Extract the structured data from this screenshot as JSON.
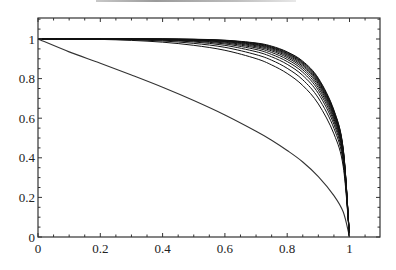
{
  "chart_data": {
    "type": "line",
    "title": "",
    "xlabel": "",
    "ylabel": "",
    "xlim": [
      0,
      1.1
    ],
    "ylim": [
      0,
      1.1
    ],
    "grid": false,
    "legend": null,
    "x_ticks": [
      "0",
      "0.2",
      "0.4",
      "0.6",
      "0.8",
      "1"
    ],
    "y_ticks": [
      "0",
      "0.2",
      "0.4",
      "0.6",
      "0.8",
      "1"
    ],
    "x_tick_values": [
      0,
      0.2,
      0.4,
      0.6,
      0.8,
      1
    ],
    "y_tick_values": [
      0,
      0.2,
      0.4,
      0.6,
      0.8,
      1
    ],
    "line_color": "#000000",
    "x": [
      0,
      0.1,
      0.2,
      0.3,
      0.4,
      0.5,
      0.6,
      0.7,
      0.75,
      0.8,
      0.85,
      0.9,
      0.95,
      0.98,
      1
    ],
    "series": [
      {
        "name": "curve-lower",
        "values": [
          1,
          0.935,
          0.878,
          0.818,
          0.756,
          0.689,
          0.616,
          0.534,
          0.489,
          0.437,
          0.379,
          0.305,
          0.209,
          0.126,
          0
        ]
      },
      {
        "name": "curve-1",
        "values": [
          1,
          1,
          0.998,
          0.993,
          0.984,
          0.968,
          0.943,
          0.901,
          0.869,
          0.826,
          0.765,
          0.672,
          0.521,
          0.354,
          0
        ]
      },
      {
        "name": "curve-2",
        "values": [
          1,
          1,
          0.999,
          0.996,
          0.99,
          0.978,
          0.958,
          0.921,
          0.893,
          0.852,
          0.794,
          0.702,
          0.549,
          0.375,
          0
        ]
      },
      {
        "name": "curve-3",
        "values": [
          1,
          1,
          1,
          0.998,
          0.994,
          0.985,
          0.968,
          0.936,
          0.91,
          0.872,
          0.816,
          0.725,
          0.569,
          0.39,
          0
        ]
      },
      {
        "name": "curve-4",
        "values": [
          1,
          1,
          1,
          0.999,
          0.996,
          0.989,
          0.975,
          0.947,
          0.922,
          0.886,
          0.832,
          0.741,
          0.584,
          0.401,
          0
        ]
      },
      {
        "name": "curve-5",
        "values": [
          1,
          1,
          1,
          0.999,
          0.997,
          0.992,
          0.98,
          0.955,
          0.932,
          0.897,
          0.844,
          0.754,
          0.596,
          0.41,
          0
        ]
      },
      {
        "name": "curve-6",
        "values": [
          1,
          1,
          1,
          1,
          0.998,
          0.994,
          0.984,
          0.961,
          0.94,
          0.906,
          0.854,
          0.765,
          0.606,
          0.417,
          0
        ]
      },
      {
        "name": "curve-7",
        "values": [
          1,
          1,
          1,
          1,
          0.999,
          0.995,
          0.987,
          0.966,
          0.946,
          0.913,
          0.862,
          0.774,
          0.614,
          0.423,
          0
        ]
      },
      {
        "name": "curve-8",
        "values": [
          1,
          1,
          1,
          1,
          0.999,
          0.996,
          0.989,
          0.97,
          0.951,
          0.919,
          0.869,
          0.781,
          0.621,
          0.428,
          0
        ]
      },
      {
        "name": "curve-9",
        "values": [
          1,
          1,
          1,
          1,
          0.999,
          0.997,
          0.991,
          0.973,
          0.955,
          0.924,
          0.875,
          0.787,
          0.627,
          0.433,
          0
        ]
      },
      {
        "name": "curve-10",
        "values": [
          1,
          1,
          1,
          1,
          1,
          0.998,
          0.992,
          0.976,
          0.958,
          0.928,
          0.88,
          0.793,
          0.632,
          0.437,
          0
        ]
      },
      {
        "name": "curve-11",
        "values": [
          1,
          1,
          1,
          1,
          1,
          0.998,
          0.993,
          0.978,
          0.961,
          0.932,
          0.884,
          0.798,
          0.637,
          0.44,
          0
        ]
      },
      {
        "name": "curve-12",
        "values": [
          1,
          1,
          1,
          1,
          1,
          0.999,
          0.994,
          0.98,
          0.964,
          0.935,
          0.888,
          0.802,
          0.641,
          0.443,
          0
        ]
      }
    ]
  }
}
